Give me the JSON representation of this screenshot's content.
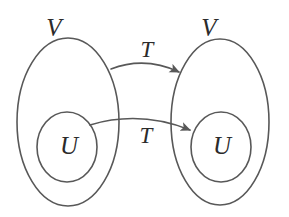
{
  "diagram": {
    "type": "set-mapping-diagram",
    "background_color": "#ffffff",
    "stroke_color": "#585858",
    "text_color": "#2b2b2b",
    "canvas": {
      "width": 289,
      "height": 217
    },
    "labels": {
      "left_outer_set": "V",
      "left_inner_set": "U",
      "right_outer_set": "V",
      "right_inner_set": "U",
      "upper_map": "T",
      "lower_map": "T"
    },
    "shapes": {
      "left_outer_ellipse": {
        "cx": 68,
        "cy": 122,
        "rx": 51,
        "ry": 84
      },
      "left_inner_ellipse": {
        "cx": 67,
        "cy": 147,
        "rx": 30,
        "ry": 35
      },
      "right_outer_ellipse": {
        "cx": 220,
        "cy": 122,
        "rx": 49,
        "ry": 83
      },
      "right_inner_ellipse": {
        "cx": 221,
        "cy": 147,
        "rx": 30,
        "ry": 35
      }
    },
    "arrows": {
      "upper": {
        "label": "T",
        "from": "left_outer_ellipse",
        "to": "right_outer_ellipse",
        "start": {
          "x": 111,
          "y": 69
        },
        "end": {
          "x": 179,
          "y": 72
        },
        "control": {
          "x": 145,
          "y": 56
        }
      },
      "lower": {
        "label": "T",
        "from": "left_inner_ellipse",
        "to": "right_inner_ellipse",
        "start": {
          "x": 90,
          "y": 125
        },
        "end": {
          "x": 190,
          "y": 130
        },
        "control": {
          "x": 140,
          "y": 110
        }
      }
    },
    "label_positions": {
      "left_outer_set": {
        "x": 54,
        "y": 27
      },
      "right_outer_set": {
        "x": 209,
        "y": 27
      },
      "upper_map": {
        "x": 147,
        "y": 49
      },
      "lower_map": {
        "x": 146,
        "y": 135
      },
      "left_inner_set": {
        "x": 69,
        "y": 145
      },
      "right_inner_set": {
        "x": 222,
        "y": 145
      }
    }
  }
}
